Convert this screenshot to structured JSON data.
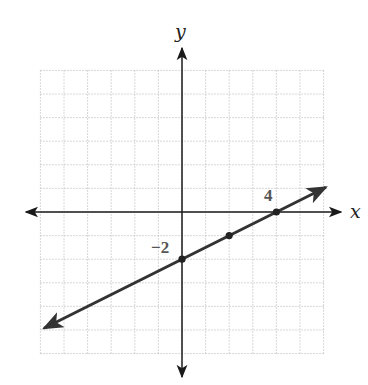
{
  "chart_data": {
    "type": "line",
    "title": "",
    "xlabel": "x",
    "ylabel": "y",
    "xlim": [
      -6,
      6
    ],
    "ylim": [
      -6,
      6
    ],
    "grid": true,
    "grid_step": 1,
    "legend": null,
    "series": [
      {
        "name": "line",
        "equation": "y = 0.5x - 2",
        "slope": 0.5,
        "intercept": -2,
        "x": [
          0,
          2,
          4
        ],
        "y": [
          -2,
          -1,
          0
        ],
        "extends_both_directions": true
      }
    ],
    "annotations": [
      {
        "text": "4",
        "x": 4,
        "y": 0,
        "meaning": "x-intercept"
      },
      {
        "text": "−2",
        "x": 0,
        "y": -2,
        "meaning": "y-intercept"
      }
    ]
  },
  "labels": {
    "x_axis": "x",
    "y_axis": "y",
    "x_intercept": "4",
    "y_intercept": "−2"
  },
  "colors": {
    "grid": "#b8b8b8",
    "axes": "#1a1a1a",
    "line": "#333333",
    "points": "#222222",
    "tick_label": "#555555"
  }
}
